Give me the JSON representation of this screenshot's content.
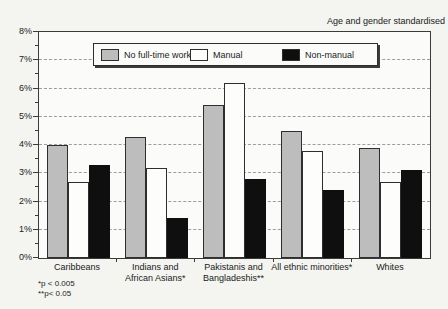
{
  "title": "Age and gender standardised",
  "footnotes": [
    "*p < 0.005",
    "**p< 0.05"
  ],
  "chart_data": {
    "type": "bar",
    "title": "Age and gender standardised",
    "categories": [
      "Caribbeans",
      "Indians and\nAfrican Asians*",
      "Pakistanis and\nBangladeshis**",
      "All ethnic minorities*",
      "Whites"
    ],
    "series": [
      {
        "name": "No full-time worker",
        "color": "#bdbdbd",
        "border": "#2e2e2e",
        "values": [
          4.0,
          4.3,
          5.4,
          4.5,
          3.9
        ]
      },
      {
        "name": "Manual",
        "color": "#fdfdfc",
        "border": "#2e2e2e",
        "values": [
          2.7,
          3.2,
          6.2,
          3.8,
          2.7
        ]
      },
      {
        "name": "Non-manual",
        "color": "#0f0f0f",
        "border": "#0f0f0f",
        "values": [
          3.3,
          1.4,
          2.8,
          2.4,
          3.1
        ]
      }
    ],
    "xlabel": "",
    "ylabel": "",
    "ylim": [
      0,
      8
    ],
    "ytick_step": 1,
    "ytick_minor_step": 0.5,
    "ytick_suffix": "%",
    "grid": "horizontal-dashed",
    "legend_position": "top-inside"
  }
}
